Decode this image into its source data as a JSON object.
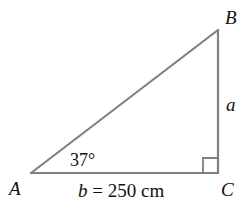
{
  "diagram": {
    "type": "right-triangle",
    "line_color": "#808080",
    "text_color": "#111111",
    "vertices": {
      "A": {
        "label": "A",
        "x": 31,
        "y": 173
      },
      "B": {
        "label": "B",
        "x": 218,
        "y": 30
      },
      "C": {
        "label": "C",
        "x": 218,
        "y": 173
      }
    },
    "angle_A": {
      "label": "37°",
      "value_deg": 37
    },
    "right_angle_at": "C",
    "sides": {
      "a": {
        "label": "a",
        "between": "B-C"
      },
      "b": {
        "label_var": "b",
        "label_rest": " = 250 cm",
        "value": 250,
        "unit": "cm",
        "between": "A-C"
      }
    }
  }
}
